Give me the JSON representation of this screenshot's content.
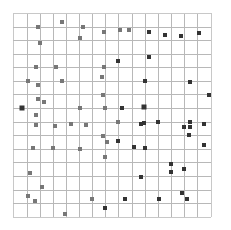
{
  "diagram": {
    "type": "grid-scatter",
    "background": "#ffffff",
    "grid": {
      "x_lines": [
        13,
        27,
        40,
        53,
        66,
        79,
        92,
        105,
        118,
        132,
        145,
        158,
        171,
        184,
        197,
        211
      ],
      "y_lines": [
        13,
        27,
        40,
        54,
        67,
        81,
        94,
        108,
        122,
        135,
        149,
        162,
        176,
        190,
        203,
        217
      ],
      "columns": 15,
      "rows": 15,
      "line_color": "#b8b8b8",
      "border_color": "#c8c8c8"
    },
    "marker_style": {
      "shape": "square",
      "size": 4,
      "color_light": "#777777",
      "color_dark": "#333333"
    },
    "markers": [
      {
        "x": 38,
        "y": 27,
        "tone": "light"
      },
      {
        "x": 62,
        "y": 22,
        "tone": "light"
      },
      {
        "x": 40,
        "y": 43,
        "tone": "light"
      },
      {
        "x": 36,
        "y": 67,
        "tone": "light"
      },
      {
        "x": 56,
        "y": 67,
        "tone": "light"
      },
      {
        "x": 83,
        "y": 27,
        "tone": "light"
      },
      {
        "x": 80,
        "y": 38,
        "tone": "light"
      },
      {
        "x": 104,
        "y": 32,
        "tone": "light"
      },
      {
        "x": 120,
        "y": 30,
        "tone": "light"
      },
      {
        "x": 129,
        "y": 30,
        "tone": "light"
      },
      {
        "x": 149,
        "y": 32,
        "tone": "dark"
      },
      {
        "x": 118,
        "y": 61,
        "tone": "dark"
      },
      {
        "x": 149,
        "y": 57,
        "tone": "dark"
      },
      {
        "x": 104,
        "y": 67,
        "tone": "light"
      },
      {
        "x": 102,
        "y": 77,
        "tone": "light"
      },
      {
        "x": 165,
        "y": 35,
        "tone": "dark"
      },
      {
        "x": 181,
        "y": 36,
        "tone": "dark"
      },
      {
        "x": 199,
        "y": 33,
        "tone": "dark"
      },
      {
        "x": 190,
        "y": 82,
        "tone": "dark"
      },
      {
        "x": 28,
        "y": 81,
        "tone": "light"
      },
      {
        "x": 62,
        "y": 81,
        "tone": "light"
      },
      {
        "x": 38,
        "y": 85,
        "tone": "light"
      },
      {
        "x": 38,
        "y": 99,
        "tone": "light"
      },
      {
        "x": 44,
        "y": 102,
        "tone": "light"
      },
      {
        "x": 22,
        "y": 108,
        "tone": "dark",
        "size": 5
      },
      {
        "x": 36,
        "y": 115,
        "tone": "light"
      },
      {
        "x": 36,
        "y": 125,
        "tone": "light"
      },
      {
        "x": 55,
        "y": 126,
        "tone": "light"
      },
      {
        "x": 71,
        "y": 124,
        "tone": "light"
      },
      {
        "x": 33,
        "y": 148,
        "tone": "light"
      },
      {
        "x": 53,
        "y": 148,
        "tone": "light"
      },
      {
        "x": 145,
        "y": 81,
        "tone": "dark"
      },
      {
        "x": 103,
        "y": 95,
        "tone": "light"
      },
      {
        "x": 80,
        "y": 108,
        "tone": "light"
      },
      {
        "x": 105,
        "y": 108,
        "tone": "light"
      },
      {
        "x": 122,
        "y": 108,
        "tone": "dark"
      },
      {
        "x": 144,
        "y": 107,
        "tone": "dark",
        "size": 5
      },
      {
        "x": 86,
        "y": 125,
        "tone": "light"
      },
      {
        "x": 118,
        "y": 122,
        "tone": "light"
      },
      {
        "x": 141,
        "y": 124,
        "tone": "dark"
      },
      {
        "x": 144,
        "y": 123,
        "tone": "dark"
      },
      {
        "x": 103,
        "y": 136,
        "tone": "light"
      },
      {
        "x": 107,
        "y": 142,
        "tone": "light"
      },
      {
        "x": 118,
        "y": 141,
        "tone": "dark"
      },
      {
        "x": 134,
        "y": 147,
        "tone": "dark"
      },
      {
        "x": 145,
        "y": 148,
        "tone": "dark"
      },
      {
        "x": 80,
        "y": 149,
        "tone": "light"
      },
      {
        "x": 209,
        "y": 95,
        "tone": "dark"
      },
      {
        "x": 158,
        "y": 122,
        "tone": "dark"
      },
      {
        "x": 184,
        "y": 127,
        "tone": "dark"
      },
      {
        "x": 190,
        "y": 122,
        "tone": "dark"
      },
      {
        "x": 190,
        "y": 127,
        "tone": "dark"
      },
      {
        "x": 204,
        "y": 124,
        "tone": "dark"
      },
      {
        "x": 189,
        "y": 135,
        "tone": "dark"
      },
      {
        "x": 204,
        "y": 145,
        "tone": "dark"
      },
      {
        "x": 30,
        "y": 173,
        "tone": "light"
      },
      {
        "x": 42,
        "y": 187,
        "tone": "light"
      },
      {
        "x": 28,
        "y": 196,
        "tone": "light"
      },
      {
        "x": 35,
        "y": 201,
        "tone": "light"
      },
      {
        "x": 65,
        "y": 214,
        "tone": "light"
      },
      {
        "x": 105,
        "y": 157,
        "tone": "light"
      },
      {
        "x": 141,
        "y": 177,
        "tone": "dark"
      },
      {
        "x": 92,
        "y": 199,
        "tone": "light"
      },
      {
        "x": 105,
        "y": 208,
        "tone": "dark"
      },
      {
        "x": 125,
        "y": 199,
        "tone": "dark"
      },
      {
        "x": 159,
        "y": 199,
        "tone": "dark"
      },
      {
        "x": 171,
        "y": 164,
        "tone": "dark"
      },
      {
        "x": 171,
        "y": 172,
        "tone": "dark"
      },
      {
        "x": 184,
        "y": 169,
        "tone": "dark"
      },
      {
        "x": 182,
        "y": 193,
        "tone": "dark"
      },
      {
        "x": 187,
        "y": 199,
        "tone": "dark"
      }
    ]
  }
}
